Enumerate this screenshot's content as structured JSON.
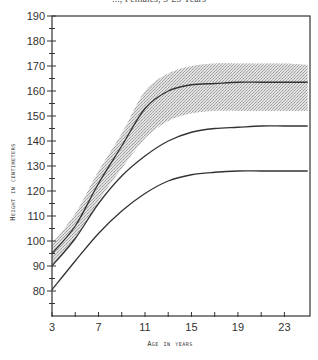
{
  "chart_data": {
    "type": "line",
    "title": "..., Females, 3-25 Years",
    "xlabel": "Age in years",
    "ylabel": "Height in centimeters",
    "xlim": [
      3,
      25.2
    ],
    "ylim": [
      70,
      190
    ],
    "x_ticks": [
      3,
      7,
      11,
      15,
      19,
      23
    ],
    "x_minor_ticks": [
      5,
      9,
      13,
      17,
      21
    ],
    "y_ticks": [
      80,
      90,
      100,
      110,
      120,
      130,
      140,
      150,
      160,
      170,
      180,
      190
    ],
    "grid": false,
    "legend": null,
    "x": [
      3,
      5,
      7,
      9,
      11,
      13,
      15,
      17,
      19,
      21,
      23,
      25
    ],
    "series": [
      {
        "name": "Shaded band upper edge",
        "style": "shade-edge",
        "values": [
          99,
          111,
          128,
          143,
          160,
          167,
          170,
          171,
          171,
          171,
          171,
          170.5
        ]
      },
      {
        "name": "Upper curve",
        "style": "line",
        "values": [
          95,
          106,
          123,
          138,
          153,
          160,
          162.5,
          163,
          163.5,
          163.5,
          163.5,
          163.5
        ]
      },
      {
        "name": "Shaded band lower edge",
        "style": "shade-edge",
        "values": [
          90,
          101,
          116,
          129,
          141,
          148,
          151,
          152,
          152,
          152,
          152,
          152
        ]
      },
      {
        "name": "Middle curve",
        "style": "line",
        "values": [
          90,
          101,
          115,
          126,
          134,
          140,
          143.5,
          145,
          145.5,
          146,
          146,
          146
        ]
      },
      {
        "name": "Lower curve",
        "style": "line",
        "values": [
          80.5,
          92,
          103,
          112,
          119,
          124,
          126.5,
          127.5,
          128,
          128,
          128,
          128
        ]
      }
    ],
    "shaded_region": {
      "between": [
        "Shaded band upper edge",
        "Shaded band lower edge"
      ],
      "color": "#c8c8c8"
    }
  },
  "labels": {
    "title": "..., Females, 3-25 Years",
    "xlabel": "Age in years",
    "ylabel": "Height in centimeters"
  },
  "colors": {
    "line": "#333333",
    "axis": "#333333",
    "shade": "#cfcfcf"
  }
}
